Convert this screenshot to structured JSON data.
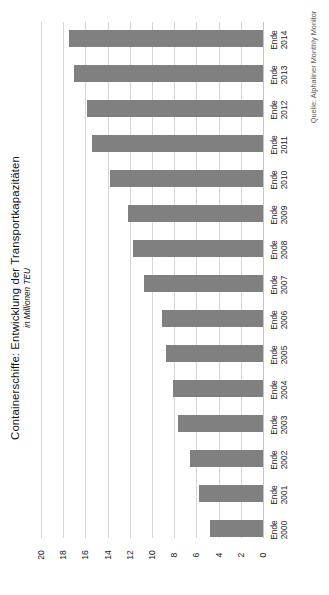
{
  "chart_data": {
    "type": "bar",
    "orientation": "horizontal",
    "title": "Containerschiffe: Entwicklung der Transportkapazitäten",
    "subtitle": "in Millionen TEU",
    "source": "Quelle: Alphaliner Monthly Monitor",
    "xlabel": "",
    "ylabel": "",
    "xlim": [
      20,
      0
    ],
    "x_axis_reversed": true,
    "grid": true,
    "legend": "none",
    "bar_color": "#808080",
    "grid_color": "#d6d6d6",
    "xticks": [
      "20",
      "18",
      "16",
      "14",
      "12",
      "10",
      "8",
      "6",
      "4",
      "2",
      "0"
    ],
    "xtick_values": [
      20,
      18,
      16,
      14,
      12,
      10,
      8,
      6,
      4,
      2,
      0
    ],
    "categories": [
      "Ende 2014",
      "Ende 2013",
      "Ende 2012",
      "Ende 2011",
      "Ende 2010",
      "Ende 2009",
      "Ende 2008",
      "Ende 2007",
      "Ende 2006",
      "Ende 2005",
      "Ende 2004",
      "Ende 2003",
      "Ende 2002",
      "Ende 2001",
      "Ende 2000"
    ],
    "category_lines": [
      {
        "l1": "Ende",
        "l2": "2014"
      },
      {
        "l1": "Ende",
        "l2": "2013"
      },
      {
        "l1": "Ende",
        "l2": "2012"
      },
      {
        "l1": "Ende",
        "l2": "2011"
      },
      {
        "l1": "Ende",
        "l2": "2010"
      },
      {
        "l1": "Ende",
        "l2": "2009"
      },
      {
        "l1": "Ende",
        "l2": "2008"
      },
      {
        "l1": "Ende",
        "l2": "2007"
      },
      {
        "l1": "Ende",
        "l2": "2006"
      },
      {
        "l1": "Ende",
        "l2": "2005"
      },
      {
        "l1": "Ende",
        "l2": "2004"
      },
      {
        "l1": "Ende",
        "l2": "2003"
      },
      {
        "l1": "Ende",
        "l2": "2002"
      },
      {
        "l1": "Ende",
        "l2": "2001"
      },
      {
        "l1": "Ende",
        "l2": "2000"
      }
    ],
    "values": [
      17.5,
      17.0,
      15.9,
      15.4,
      13.8,
      12.2,
      11.7,
      10.7,
      9.1,
      8.7,
      8.1,
      7.7,
      6.6,
      5.8,
      4.8
    ]
  }
}
